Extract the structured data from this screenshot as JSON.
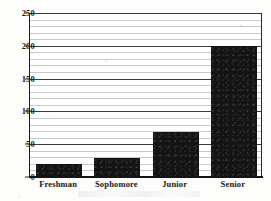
{
  "chart_data": {
    "type": "bar",
    "title": "",
    "xlabel": "",
    "ylabel": "",
    "categories": [
      "Freshman",
      "Sophomore",
      "Junior",
      "Senior"
    ],
    "values": [
      20,
      29,
      68,
      200
    ],
    "ylim": [
      0,
      250
    ],
    "ytick_labels": [
      "0",
      "50",
      "100",
      "150",
      "200",
      "250"
    ],
    "ytick_values": [
      0,
      50,
      100,
      150,
      200,
      250
    ],
    "minor_tick_step": 10,
    "grid": true,
    "grid_orientation": "horizontal",
    "legend": null,
    "legend_position": "none",
    "bar_color": "#141414",
    "gridline_color": "#c9c9c9",
    "major_gridline_color": "#3a3a3a",
    "axis_color": "#141414"
  }
}
